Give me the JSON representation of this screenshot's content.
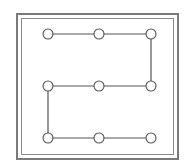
{
  "diagram": {
    "type": "grid-path",
    "rows": 3,
    "cols": 3,
    "nodes": [
      {
        "id": "r1c1",
        "x": 48,
        "y": 34
      },
      {
        "id": "r1c2",
        "x": 99,
        "y": 34
      },
      {
        "id": "r1c3",
        "x": 151,
        "y": 34
      },
      {
        "id": "r2c1",
        "x": 48,
        "y": 86
      },
      {
        "id": "r2c2",
        "x": 99,
        "y": 86
      },
      {
        "id": "r2c3",
        "x": 151,
        "y": 86
      },
      {
        "id": "r3c1",
        "x": 48,
        "y": 138
      },
      {
        "id": "r3c2",
        "x": 99,
        "y": 138
      },
      {
        "id": "r3c3",
        "x": 151,
        "y": 138
      }
    ],
    "path": [
      "r1c1",
      "r1c2",
      "r1c3",
      "r2c3",
      "r2c2",
      "r2c1",
      "r3c1",
      "r3c2",
      "r3c3"
    ],
    "node_radius": 5,
    "stroke_color": "#555555",
    "frame_color": "#7a7a7a"
  }
}
